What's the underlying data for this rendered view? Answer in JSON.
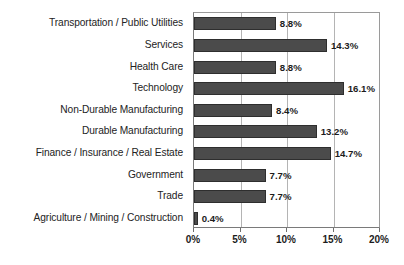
{
  "chart_data": {
    "type": "bar",
    "orientation": "horizontal",
    "title": "",
    "xlabel": "",
    "ylabel": "",
    "xlim": [
      0,
      20
    ],
    "xtick_values": [
      0,
      5,
      10,
      15,
      20
    ],
    "xtick_labels": [
      "0%",
      "5%",
      "10%",
      "15%",
      "20%"
    ],
    "grid": true,
    "legend": false,
    "value_suffix": "%",
    "categories": [
      "Transportation / Public Utilities",
      "Services",
      "Health Care",
      "Technology",
      "Non-Durable Manufacturing",
      "Durable Manufacturing",
      "Finance / Insurance / Real Estate",
      "Government",
      "Trade",
      "Agriculture / Mining / Construction"
    ],
    "values": [
      8.8,
      14.3,
      8.8,
      16.1,
      8.4,
      13.2,
      14.7,
      7.7,
      7.7,
      0.4
    ],
    "value_labels": [
      "8.8%",
      "14.3%",
      "8.8%",
      "16.1%",
      "8.4%",
      "13.2%",
      "14.7%",
      "7.7%",
      "7.7%",
      "0.4%"
    ],
    "bar_color": "#4b4b4b",
    "bar_edge_color": "#2e2e2e",
    "gridline_color": "#b4b4b4",
    "axis_color": "#7a7a7a",
    "background_color": "#ffffff"
  }
}
